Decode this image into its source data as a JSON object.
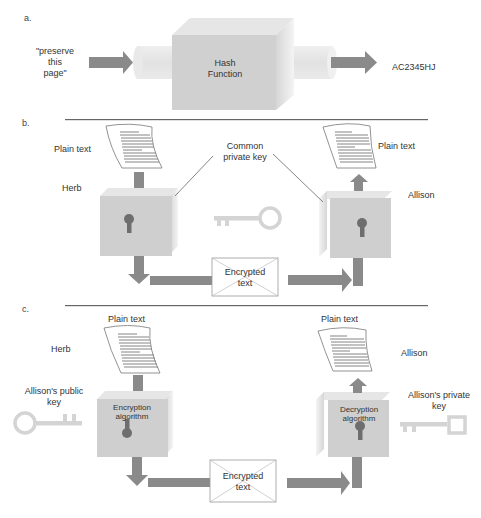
{
  "sections": {
    "a": {
      "label": "a.",
      "input_text_line1": "\"preserve",
      "input_text_line2": "this",
      "input_text_line3": "page\"",
      "box_line1": "Hash",
      "box_line2": "Function",
      "output_text": "AC2345HJ"
    },
    "b": {
      "label": "b.",
      "plain_text_left": "Plain text",
      "plain_text_right": "Plain text",
      "key_label_line1": "Common",
      "key_label_line2": "private key",
      "sender": "Herb",
      "receiver": "Allison",
      "envelope_line1": "Encrypted",
      "envelope_line2": "text"
    },
    "c": {
      "label": "c.",
      "plain_text_left": "Plain text",
      "plain_text_right": "Plain text",
      "sender": "Herb",
      "receiver": "Allison",
      "public_key_line1": "Allison's public",
      "public_key_line2": "key",
      "private_key_line1": "Allison's private",
      "private_key_line2": "key",
      "enc_box_line1": "Encryption",
      "enc_box_line2": "algorithm",
      "dec_box_line1": "Decryption",
      "dec_box_line2": "algorithm",
      "envelope_line1": "Encrypted",
      "envelope_line2": "text"
    }
  },
  "colors": {
    "arrow": "#8a8a8a",
    "box_front": "#cfcfcf",
    "box_top": "#e4e4e4",
    "box_side": "#d9d9d9",
    "cylinder": "#e6e6e6",
    "key": "#d4d4d4",
    "keyhole": "#6e6e6e",
    "rule": "#666666"
  }
}
